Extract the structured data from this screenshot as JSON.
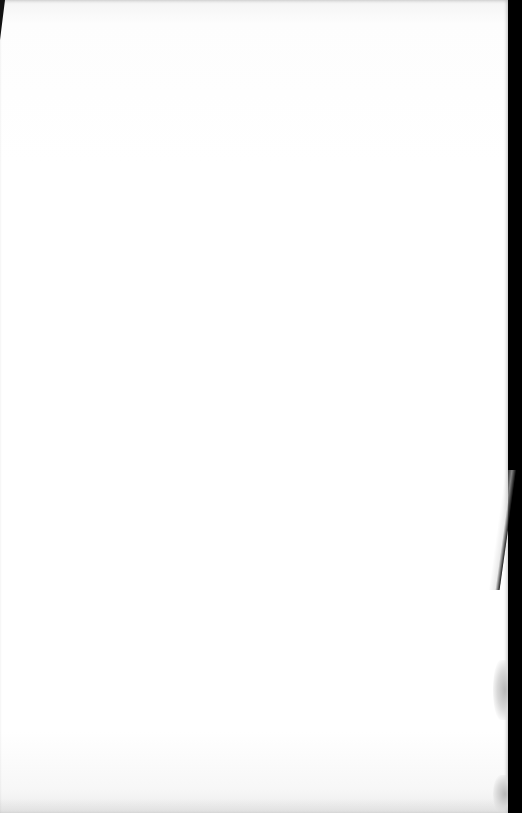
{
  "document": {
    "type": "blank paper page",
    "content": "",
    "colors": {
      "paper": "#ffffff",
      "background": "#000000",
      "edge_texture": "#c0c0c0"
    }
  }
}
